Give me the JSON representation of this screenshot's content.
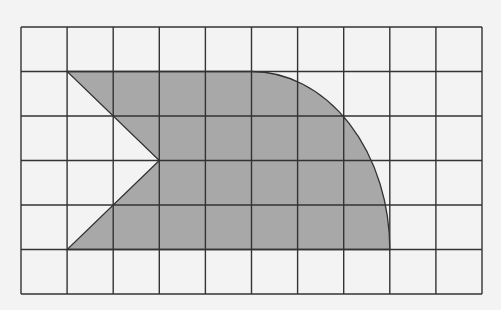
{
  "diagram": {
    "type": "grid-shape",
    "grid": {
      "columns": 10,
      "rows": 6,
      "left": 21,
      "top": 27,
      "cell_width": 46.1,
      "cell_height": 44.5,
      "line_color": "#333333"
    },
    "shape": {
      "fill": "#a8a8a8",
      "stroke": "#333333",
      "vertices_grid_units": [
        [
          1,
          1
        ],
        [
          5,
          1
        ],
        [
          8,
          5
        ],
        [
          1,
          5
        ],
        [
          3,
          3
        ]
      ],
      "arc": {
        "from": [
          5,
          1
        ],
        "to": [
          8,
          5
        ],
        "center": [
          5,
          5
        ],
        "rx": 3,
        "ry": 4,
        "kind": "quarter-ellipse"
      }
    },
    "background": "#f3f3f3"
  }
}
